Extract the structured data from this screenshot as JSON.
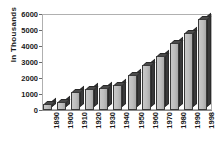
{
  "chart_data": {
    "type": "bar",
    "title": "",
    "xlabel": "",
    "ylabel": "In  Thousands",
    "categories": [
      "1890",
      "1900",
      "1910",
      "1920",
      "1930",
      "1940",
      "1950",
      "1960",
      "1970",
      "1980",
      "1990",
      "1998"
    ],
    "values": [
      400,
      500,
      1100,
      1300,
      1350,
      1550,
      2200,
      2800,
      3400,
      4200,
      4800,
      5700
    ],
    "ylim": [
      0,
      6000
    ],
    "yticks": [
      "0",
      "1000",
      "2000",
      "3000",
      "4000",
      "5000",
      "6000"
    ],
    "ytick_values": [
      0,
      1000,
      2000,
      3000,
      4000,
      5000,
      6000
    ],
    "grid": false,
    "legend": "none",
    "style": "3d-column",
    "colors": {
      "bar_front": "#bdbdbd",
      "bar_side": "#39393a",
      "bar_top": "#4a4a4a",
      "bar_outline": "#3a3a3a",
      "axis": "#b0b0b0",
      "text": "#1a1a1a",
      "background": "#ffffff"
    }
  }
}
